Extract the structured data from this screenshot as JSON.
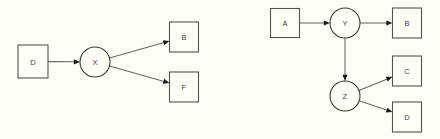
{
  "canvas": {
    "width": 440,
    "height": 139,
    "background_color": "#fffff8",
    "node_stroke_color": "#555150",
    "edge_color": "#6b6664",
    "arrowhead_color": "#1c1a19",
    "label_color": "#49403c"
  },
  "diagrams": [
    {
      "id": "left-diagram",
      "name": "left-dag",
      "nodes": [
        {
          "id": "d_left",
          "label": "D",
          "shape": "rect",
          "cx": 33,
          "cy": 61.5,
          "w": 30,
          "h": 33
        },
        {
          "id": "x_left",
          "label": "X",
          "shape": "circle",
          "cx": 95,
          "cy": 62,
          "r": 15
        },
        {
          "id": "b_left",
          "label": "B",
          "shape": "rect",
          "cx": 184,
          "cy": 37,
          "w": 29,
          "h": 30
        },
        {
          "id": "f_left",
          "label": "F",
          "shape": "rect",
          "cx": 184,
          "cy": 87,
          "w": 29,
          "h": 30
        }
      ],
      "edges": [
        {
          "from": "d_left",
          "to": "x_left",
          "label": ""
        },
        {
          "from": "x_left",
          "to": "b_left",
          "label": ""
        },
        {
          "from": "x_left",
          "to": "f_left",
          "label": ""
        }
      ]
    },
    {
      "id": "right-diagram",
      "name": "right-dag",
      "nodes": [
        {
          "id": "a_right",
          "label": "A",
          "shape": "rect",
          "cx": 285,
          "cy": 23,
          "w": 29,
          "h": 29
        },
        {
          "id": "y_right",
          "label": "Y",
          "shape": "circle",
          "cx": 345,
          "cy": 23,
          "r": 15
        },
        {
          "id": "b_right",
          "label": "B",
          "shape": "rect",
          "cx": 407,
          "cy": 23,
          "w": 29,
          "h": 30
        },
        {
          "id": "z_right",
          "label": "Z",
          "shape": "circle",
          "cx": 345,
          "cy": 96,
          "r": 15
        },
        {
          "id": "c_right",
          "label": "C",
          "shape": "rect",
          "cx": 407,
          "cy": 71,
          "w": 29,
          "h": 30
        },
        {
          "id": "d_right",
          "label": "D",
          "shape": "rect",
          "cx": 407,
          "cy": 117,
          "w": 29,
          "h": 30
        }
      ],
      "edges": [
        {
          "from": "a_right",
          "to": "y_right",
          "label": ""
        },
        {
          "from": "y_right",
          "to": "b_right",
          "label": ""
        },
        {
          "from": "y_right",
          "to": "z_right",
          "label": ""
        },
        {
          "from": "z_right",
          "to": "c_right",
          "label": ""
        },
        {
          "from": "z_right",
          "to": "d_right",
          "label": ""
        }
      ]
    }
  ]
}
